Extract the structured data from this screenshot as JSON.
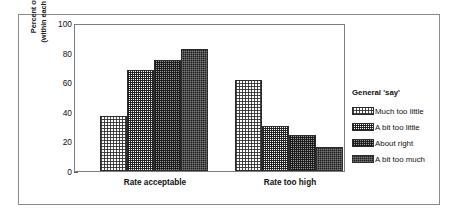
{
  "chart_data": {
    "type": "bar",
    "title": "",
    "xlabel": "",
    "ylabel": "Percent of employees (within each 'say' category)",
    "ylabel_line1": "Percent of employees",
    "ylabel_line2": "(within each 'say' category)",
    "categories": [
      "Rate acceptable",
      "Rate too high"
    ],
    "ylim": [
      0,
      100
    ],
    "yticks": [
      0,
      20,
      40,
      60,
      80,
      100
    ],
    "ytick_labels": [
      "0",
      "20",
      "40",
      "60",
      "80",
      "100"
    ],
    "grid": false,
    "legend_position": "right",
    "legend_title": "General 'say'",
    "series": [
      {
        "name": "Much too little",
        "values": [
          38,
          62
        ],
        "fill": "light-dither"
      },
      {
        "name": "A bit too little",
        "values": [
          69.5,
          31
        ],
        "fill": "medium-light-dither"
      },
      {
        "name": "About right",
        "values": [
          76,
          25
        ],
        "fill": "medium-dark-dither"
      },
      {
        "name": "A bit too much",
        "values": [
          83.5,
          16.5
        ],
        "fill": "dark-dither"
      }
    ]
  },
  "colors": {
    "frame": "#8a8a8a",
    "axis": "#7d7d7d",
    "bar_outline": "#2b2b2b",
    "text": "#111111",
    "background": "#ffffff"
  }
}
